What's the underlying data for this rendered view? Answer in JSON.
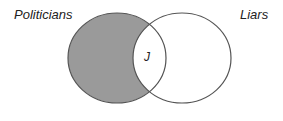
{
  "diagram": {
    "type": "venn",
    "sets": [
      {
        "label": "Politicians",
        "shaded": true
      },
      {
        "label": "Liars",
        "shaded": false
      }
    ],
    "intersection": {
      "label": "J",
      "shaded": false
    },
    "colors": {
      "shade": "#9a9a9a",
      "outline": "#555555",
      "background": "#ffffff",
      "text": "#222222"
    }
  }
}
